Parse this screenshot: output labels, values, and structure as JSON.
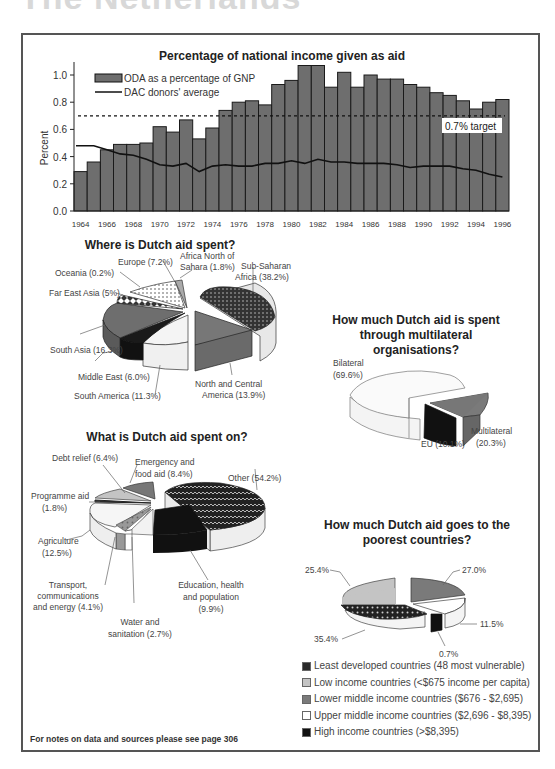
{
  "page": {
    "header": "The Netherlands",
    "footnote": "For notes on data and sources please see page 306"
  },
  "colors": {
    "bar_fill": "#6e6e6e",
    "bar_stroke": "#1a1a1a",
    "dac_line": "#111111",
    "frame": "#555555"
  },
  "chart_data": [
    {
      "type": "bar",
      "title": "Percentage of national income given as aid",
      "xlabel": "",
      "ylabel": "Percent",
      "ylim": [
        0,
        1.1
      ],
      "yticks": [
        "0.0",
        "0.2",
        "0.4",
        "0.6",
        "0.8",
        "1.0"
      ],
      "xticks": [
        "1964",
        "1966",
        "1968",
        "1970",
        "1972",
        "1974",
        "1976",
        "1978",
        "1980",
        "1982",
        "1984",
        "1986",
        "1988",
        "1990",
        "1992",
        "1994",
        "1996"
      ],
      "categories": [
        "1964",
        "1965",
        "1966",
        "1967",
        "1968",
        "1969",
        "1970",
        "1971",
        "1972",
        "1973",
        "1974",
        "1975",
        "1976",
        "1977",
        "1978",
        "1979",
        "1980",
        "1981",
        "1982",
        "1983",
        "1984",
        "1985",
        "1986",
        "1987",
        "1988",
        "1989",
        "1990",
        "1991",
        "1992",
        "1993",
        "1994",
        "1995",
        "1996"
      ],
      "series": [
        {
          "name": "ODA as a percentage of GNP",
          "type": "bar",
          "values": [
            0.29,
            0.36,
            0.45,
            0.49,
            0.49,
            0.5,
            0.62,
            0.58,
            0.67,
            0.53,
            0.61,
            0.74,
            0.8,
            0.81,
            0.78,
            0.93,
            0.96,
            1.07,
            1.07,
            0.91,
            1.02,
            0.91,
            1.0,
            0.97,
            0.97,
            0.93,
            0.91,
            0.87,
            0.85,
            0.81,
            0.75,
            0.8,
            0.82
          ]
        },
        {
          "name": "DAC donors' average",
          "type": "line",
          "values": [
            0.48,
            0.48,
            0.45,
            0.42,
            0.41,
            0.38,
            0.34,
            0.33,
            0.35,
            0.29,
            0.33,
            0.34,
            0.33,
            0.33,
            0.35,
            0.35,
            0.37,
            0.35,
            0.38,
            0.36,
            0.36,
            0.35,
            0.35,
            0.35,
            0.34,
            0.32,
            0.33,
            0.33,
            0.33,
            0.31,
            0.3,
            0.27,
            0.25
          ]
        }
      ],
      "annotations": [
        {
          "text": "0.7% target",
          "y": 0.7,
          "style": "dashed"
        }
      ],
      "legend_position": "upper left",
      "grid": false
    },
    {
      "type": "pie",
      "title": "Where is Dutch aid spent?",
      "categories": [
        "Sub-Saharan Africa",
        "North and Central America",
        "South America",
        "Middle East",
        "South Asia",
        "Far East Asia",
        "Oceania",
        "Europe",
        "Africa North of Sahara"
      ],
      "values": [
        38.2,
        13.9,
        11.3,
        6.0,
        16.3,
        5.0,
        0.2,
        7.2,
        1.8
      ],
      "labels": [
        "Sub-Saharan\nAfrica (38.2%)",
        "North and Central\nAmerica (13.9%)",
        "South America (11.3%)",
        "Middle East (6.0%)",
        "South Asia (16.3%)",
        "Far East Asia (5%)",
        "Oceania (0.2%)",
        "Europe (7.2%)",
        "Africa North of\nSahara (1.8%)"
      ]
    },
    {
      "type": "pie",
      "title": "How much Dutch aid is spent through multilateral organisations?",
      "categories": [
        "Bilateral",
        "Multilateral",
        "EU"
      ],
      "values": [
        69.6,
        20.3,
        10.1
      ],
      "labels": [
        "Bilateral\n(69.6%)",
        "Multilateral\n(20.3%)",
        "EU (10.1%)"
      ]
    },
    {
      "type": "pie",
      "title": "What is Dutch aid spent on?",
      "categories": [
        "Other",
        "Education, health and population",
        "Water and sanitation",
        "Transport, communications and energy",
        "Agriculture",
        "Programme aid",
        "Debt relief",
        "Emergency and food aid"
      ],
      "values": [
        54.2,
        9.9,
        2.7,
        4.1,
        12.5,
        1.8,
        6.4,
        8.4
      ],
      "labels": [
        "Other (54.2%)",
        "Education, health\nand population\n(9.9%)",
        "Water and\nsanitation (2.7%)",
        "Transport,\ncommunications\nand energy (4.1%)",
        "Agriculture\n(12.5%)",
        "Programme aid\n(1.8%)",
        "Debt relief (6.4%)",
        "Emergency and\nfood aid (8.4%)"
      ]
    },
    {
      "type": "pie",
      "title": "How much Dutch aid goes to the poorest countries?",
      "categories": [
        "Least developed countries (48 most vulnerable)",
        "Low income countries (<$675 income per capita)",
        "Lower middle income countries ($676 - $2,695)",
        "Upper middle income countries ($2,696 - $8,395)",
        "High income countries (>$8,395)"
      ],
      "values": [
        35.4,
        25.4,
        27.0,
        11.5,
        0.7
      ],
      "labels": [
        "35.4%",
        "25.4%",
        "27.0%",
        "11.5%",
        "0.7%"
      ],
      "legend_position": "below"
    }
  ],
  "bar_chart": {
    "title": "Percentage of national income given as aid",
    "ylabel": "Percent",
    "legend_oda": "ODA as a percentage of GNP",
    "legend_dac": "DAC donors' average",
    "target_label": "0.7% target"
  },
  "pie_region": {
    "title": "Where is Dutch aid spent?",
    "labels": {
      "ssa": [
        "Sub-Saharan",
        "Africa (38.2%)"
      ],
      "nca": [
        "North and Central",
        "America (13.9%)"
      ],
      "sam": "South America (11.3%)",
      "me": "Middle East (6.0%)",
      "sa": "South Asia (16.3%)",
      "fea": "Far East Asia (5%)",
      "oce": "Oceania (0.2%)",
      "eur": "Europe (7.2%)",
      "ans": [
        "Africa North of",
        "Sahara (1.8%)"
      ]
    }
  },
  "pie_multi": {
    "title": [
      "How much Dutch aid is spent",
      "through multilateral",
      "organisations?"
    ],
    "labels": {
      "bil": [
        "Bilateral",
        "(69.6%)"
      ],
      "mul": [
        "Multilateral",
        "(20.3%)"
      ],
      "eu": "EU (10.1%)"
    }
  },
  "pie_sector": {
    "title": "What is Dutch aid spent on?",
    "labels": {
      "other": "Other (54.2%)",
      "edu": [
        "Education, health",
        "and population",
        "(9.9%)"
      ],
      "water": [
        "Water and",
        "sanitation (2.7%)"
      ],
      "trans": [
        "Transport,",
        "communications",
        "and energy (4.1%)"
      ],
      "agri": [
        "Agriculture",
        "(12.5%)"
      ],
      "prog": [
        "Programme aid",
        "(1.8%)"
      ],
      "debt": "Debt relief (6.4%)",
      "emer": [
        "Emergency and",
        "food aid (8.4%)"
      ]
    }
  },
  "pie_poor": {
    "title": [
      "How much Dutch aid goes to the",
      "poorest countries?"
    ],
    "labels": {
      "ldc": "35.4%",
      "low": "25.4%",
      "lmi": "27.0%",
      "umi": "11.5%",
      "hi": "0.7%"
    },
    "legend": [
      {
        "label": "Least developed countries (48 most vulnerable)",
        "color": "#2a2a2a"
      },
      {
        "label": "Low income countries (<$675 income per capita)",
        "color": "#c4c4c4"
      },
      {
        "label": "Lower middle income countries ($676 - $2,695)",
        "color": "#7a7a7a"
      },
      {
        "label": "Upper middle income countries ($2,696 - $8,395)",
        "color": "#ffffff"
      },
      {
        "label": "High income countries (>$8,395)",
        "color": "#111111"
      }
    ]
  }
}
